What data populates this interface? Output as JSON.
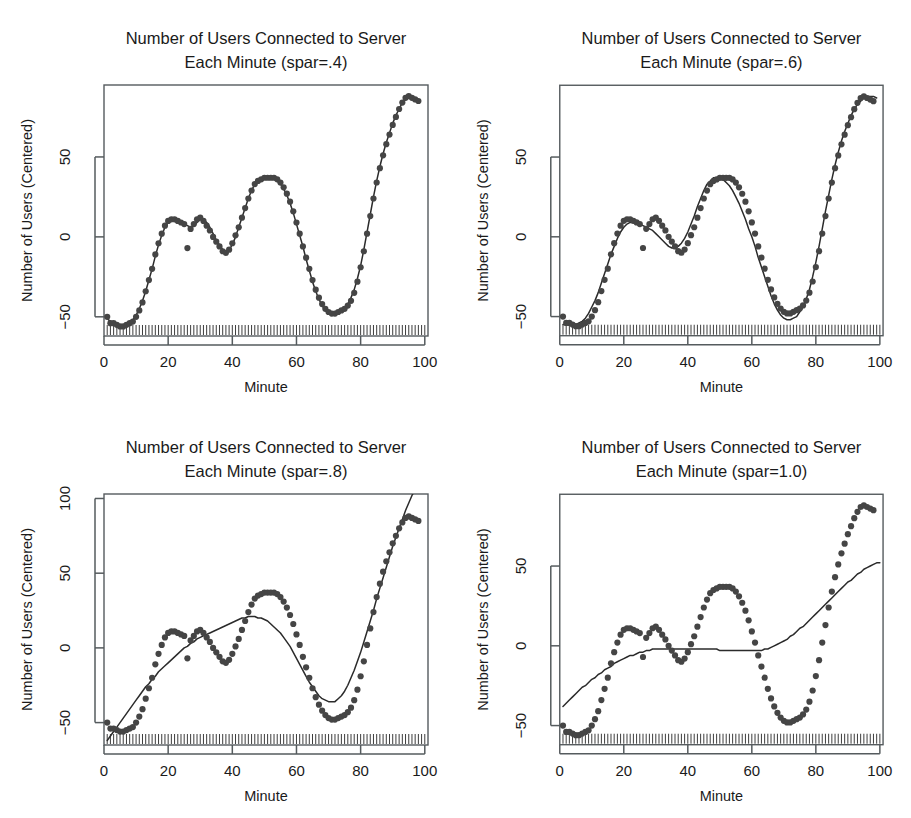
{
  "figure": {
    "panel_count": 4,
    "background_color": "#ffffff",
    "point_color": "#454545",
    "line_color": "#2b2b2b",
    "axis_color": "#555b5e"
  },
  "chart_data": [
    {
      "type": "scatter",
      "panel_index": 0,
      "title": "Number of Users Connected to Server\nEach Minute (spar=.4)",
      "title_line1": "Number of Users Connected to Server",
      "title_line2": "Each Minute (spar=.4)",
      "spar": 0.4,
      "xlabel": "Minute",
      "ylabel": "Number of Users (Centered)",
      "xlim": [
        0,
        101
      ],
      "ylim": [
        -62,
        95
      ],
      "xticks": [
        0,
        20,
        40,
        60,
        80,
        100
      ],
      "yticks": [
        -50,
        0,
        50
      ],
      "grid": false,
      "legend": null,
      "rug": true,
      "x": [
        1,
        2,
        3,
        4,
        5,
        6,
        7,
        8,
        9,
        10,
        11,
        12,
        13,
        14,
        15,
        16,
        17,
        18,
        19,
        20,
        21,
        22,
        23,
        24,
        25,
        26,
        27,
        28,
        29,
        30,
        31,
        32,
        33,
        34,
        35,
        36,
        37,
        38,
        39,
        40,
        41,
        42,
        43,
        44,
        45,
        46,
        47,
        48,
        49,
        50,
        51,
        52,
        53,
        54,
        55,
        56,
        57,
        58,
        59,
        60,
        61,
        62,
        63,
        64,
        65,
        66,
        67,
        68,
        69,
        70,
        71,
        72,
        73,
        74,
        75,
        76,
        77,
        78,
        79,
        80,
        81,
        82,
        83,
        84,
        85,
        86,
        87,
        88,
        89,
        90,
        91,
        92,
        93,
        94,
        95,
        96,
        97,
        98,
        99,
        100
      ],
      "values": [
        -50,
        -54,
        -54,
        -55,
        -56,
        -56,
        -55,
        -54,
        -53,
        -50,
        -46,
        -41,
        -34,
        -27,
        -20,
        -11,
        -4,
        2,
        7,
        10,
        11,
        11,
        10,
        9,
        8,
        -7,
        5,
        8,
        11,
        12,
        10,
        7,
        4,
        0,
        -3,
        -6,
        -9,
        -10,
        -8,
        -4,
        1,
        6,
        12,
        18,
        24,
        29,
        33,
        35,
        36,
        37,
        37,
        37,
        37,
        36,
        34,
        31,
        27,
        22,
        16,
        9,
        2,
        -6,
        -13,
        -20,
        -27,
        -33,
        -38,
        -42,
        -45,
        -47,
        -48,
        -48,
        -47,
        -46,
        -45,
        -43,
        -40,
        -35,
        -28,
        -19,
        -9,
        2,
        13,
        24,
        34,
        43,
        51,
        58,
        64,
        70,
        75,
        80,
        84,
        87,
        88,
        87,
        86,
        85
      ],
      "series": [
        {
          "name": "observed",
          "kind": "points"
        },
        {
          "name": "smoothing spline (spar=.4)",
          "kind": "line",
          "values": [
            -51,
            -53,
            -54,
            -55,
            -55,
            -55,
            -55,
            -54,
            -52,
            -49,
            -45,
            -40,
            -34,
            -27,
            -20,
            -12,
            -5,
            1,
            6,
            9,
            11,
            11,
            10,
            9,
            8,
            7,
            6,
            7,
            9,
            11,
            11,
            9,
            6,
            2,
            -2,
            -5,
            -8,
            -9,
            -8,
            -5,
            0,
            6,
            12,
            18,
            24,
            29,
            33,
            35,
            37,
            37,
            37,
            37,
            36,
            35,
            33,
            30,
            26,
            21,
            15,
            8,
            1,
            -6,
            -14,
            -21,
            -28,
            -34,
            -39,
            -43,
            -46,
            -47,
            -48,
            -48,
            -47,
            -46,
            -44,
            -42,
            -38,
            -33,
            -26,
            -18,
            -8,
            3,
            14,
            25,
            35,
            44,
            52,
            59,
            65,
            71,
            76,
            80,
            84,
            86,
            87,
            87,
            86,
            85
          ]
        }
      ]
    },
    {
      "type": "scatter",
      "panel_index": 1,
      "title": "Number of Users Connected to Server\nEach Minute (spar=.6)",
      "title_line1": "Number of Users Connected to Server",
      "title_line2": "Each Minute (spar=.6)",
      "spar": 0.6,
      "xlabel": "Minute",
      "ylabel": "Number of Users (Centered)",
      "xlim": [
        0,
        101
      ],
      "ylim": [
        -62,
        95
      ],
      "xticks": [
        0,
        20,
        40,
        60,
        80,
        100
      ],
      "yticks": [
        -50,
        0,
        50
      ],
      "grid": false,
      "legend": null,
      "rug": true,
      "x": [
        1,
        2,
        3,
        4,
        5,
        6,
        7,
        8,
        9,
        10,
        11,
        12,
        13,
        14,
        15,
        16,
        17,
        18,
        19,
        20,
        21,
        22,
        23,
        24,
        25,
        26,
        27,
        28,
        29,
        30,
        31,
        32,
        33,
        34,
        35,
        36,
        37,
        38,
        39,
        40,
        41,
        42,
        43,
        44,
        45,
        46,
        47,
        48,
        49,
        50,
        51,
        52,
        53,
        54,
        55,
        56,
        57,
        58,
        59,
        60,
        61,
        62,
        63,
        64,
        65,
        66,
        67,
        68,
        69,
        70,
        71,
        72,
        73,
        74,
        75,
        76,
        77,
        78,
        79,
        80,
        81,
        82,
        83,
        84,
        85,
        86,
        87,
        88,
        89,
        90,
        91,
        92,
        93,
        94,
        95,
        96,
        97,
        98,
        99,
        100
      ],
      "values": [
        -50,
        -54,
        -54,
        -55,
        -56,
        -56,
        -55,
        -54,
        -53,
        -50,
        -46,
        -41,
        -34,
        -27,
        -20,
        -11,
        -4,
        2,
        7,
        10,
        11,
        11,
        10,
        9,
        8,
        -7,
        5,
        8,
        11,
        12,
        10,
        7,
        4,
        0,
        -3,
        -6,
        -9,
        -10,
        -8,
        -4,
        1,
        6,
        12,
        18,
        24,
        29,
        33,
        35,
        36,
        37,
        37,
        37,
        37,
        36,
        34,
        31,
        27,
        22,
        16,
        9,
        2,
        -6,
        -13,
        -20,
        -27,
        -33,
        -38,
        -42,
        -45,
        -47,
        -48,
        -48,
        -47,
        -46,
        -45,
        -43,
        -40,
        -35,
        -28,
        -19,
        -9,
        2,
        13,
        24,
        34,
        43,
        51,
        58,
        64,
        70,
        75,
        80,
        84,
        87,
        88,
        87,
        86,
        85
      ],
      "series": [
        {
          "name": "observed",
          "kind": "points"
        },
        {
          "name": "smoothing spline (spar=.6)",
          "kind": "line",
          "values": [
            -55,
            -55,
            -55,
            -55,
            -55,
            -54,
            -53,
            -51,
            -48,
            -44,
            -40,
            -35,
            -29,
            -23,
            -17,
            -11,
            -6,
            -1,
            3,
            6,
            8,
            9,
            9,
            9,
            8,
            7,
            6,
            5,
            4,
            2,
            0,
            -2,
            -4,
            -6,
            -7,
            -7,
            -6,
            -4,
            -1,
            3,
            8,
            13,
            19,
            24,
            29,
            33,
            35,
            37,
            37,
            37,
            36,
            34,
            32,
            29,
            25,
            21,
            16,
            11,
            5,
            0,
            -6,
            -13,
            -19,
            -25,
            -31,
            -37,
            -42,
            -46,
            -49,
            -51,
            -52,
            -52,
            -51,
            -50,
            -47,
            -44,
            -39,
            -33,
            -25,
            -16,
            -6,
            5,
            16,
            26,
            36,
            45,
            53,
            60,
            66,
            71,
            76,
            80,
            83,
            85,
            87,
            88,
            88,
            88,
            87
          ]
        }
      ]
    },
    {
      "type": "scatter",
      "panel_index": 2,
      "title": "Number of Users Connected to Server\nEach Minute (spar=.8)",
      "title_line1": "Number of Users Connected to Server",
      "title_line2": "Each Minute (spar=.8)",
      "spar": 0.8,
      "xlabel": "Minute",
      "ylabel": "Number of Users (Centered)",
      "xlim": [
        0,
        101
      ],
      "ylim": [
        -65,
        103
      ],
      "xticks": [
        0,
        20,
        40,
        60,
        80,
        100
      ],
      "yticks": [
        -50,
        0,
        50,
        100
      ],
      "grid": false,
      "legend": null,
      "rug": true,
      "x": [
        1,
        2,
        3,
        4,
        5,
        6,
        7,
        8,
        9,
        10,
        11,
        12,
        13,
        14,
        15,
        16,
        17,
        18,
        19,
        20,
        21,
        22,
        23,
        24,
        25,
        26,
        27,
        28,
        29,
        30,
        31,
        32,
        33,
        34,
        35,
        36,
        37,
        38,
        39,
        40,
        41,
        42,
        43,
        44,
        45,
        46,
        47,
        48,
        49,
        50,
        51,
        52,
        53,
        54,
        55,
        56,
        57,
        58,
        59,
        60,
        61,
        62,
        63,
        64,
        65,
        66,
        67,
        68,
        69,
        70,
        71,
        72,
        73,
        74,
        75,
        76,
        77,
        78,
        79,
        80,
        81,
        82,
        83,
        84,
        85,
        86,
        87,
        88,
        89,
        90,
        91,
        92,
        93,
        94,
        95,
        96,
        97,
        98,
        99,
        100
      ],
      "values": [
        -50,
        -54,
        -54,
        -55,
        -56,
        -56,
        -55,
        -54,
        -53,
        -50,
        -46,
        -41,
        -34,
        -27,
        -20,
        -11,
        -4,
        2,
        7,
        10,
        11,
        11,
        10,
        9,
        8,
        -7,
        5,
        8,
        11,
        12,
        10,
        7,
        4,
        0,
        -3,
        -6,
        -9,
        -10,
        -8,
        -4,
        1,
        6,
        12,
        18,
        24,
        29,
        33,
        35,
        36,
        37,
        37,
        37,
        37,
        36,
        34,
        31,
        27,
        22,
        16,
        9,
        2,
        -6,
        -13,
        -20,
        -27,
        -33,
        -38,
        -42,
        -45,
        -47,
        -48,
        -48,
        -47,
        -46,
        -45,
        -43,
        -40,
        -35,
        -28,
        -19,
        -9,
        2,
        13,
        24,
        34,
        43,
        51,
        58,
        64,
        70,
        75,
        80,
        84,
        87,
        88,
        87,
        86,
        85
      ],
      "series": [
        {
          "name": "observed",
          "kind": "points"
        },
        {
          "name": "smoothing spline (spar=.8)",
          "kind": "line",
          "values": [
            -62,
            -59,
            -56,
            -53,
            -50,
            -47,
            -44,
            -41,
            -38,
            -35,
            -32,
            -29,
            -26,
            -24,
            -21,
            -19,
            -16,
            -14,
            -12,
            -10,
            -8,
            -6,
            -4,
            -2,
            0,
            1,
            3,
            4,
            6,
            7,
            8,
            9,
            10,
            11,
            12,
            13,
            14,
            15,
            16,
            17,
            18,
            19,
            20,
            20,
            21,
            21,
            21,
            20,
            20,
            19,
            18,
            16,
            14,
            12,
            10,
            7,
            4,
            1,
            -3,
            -7,
            -11,
            -15,
            -19,
            -23,
            -26,
            -29,
            -32,
            -34,
            -35,
            -36,
            -36,
            -36,
            -34,
            -32,
            -29,
            -25,
            -20,
            -15,
            -9,
            -3,
            4,
            11,
            18,
            25,
            33,
            40,
            47,
            54,
            61,
            68,
            74,
            80,
            86,
            92,
            97,
            102,
            106
          ]
        }
      ]
    },
    {
      "type": "scatter",
      "panel_index": 3,
      "title": "Number of Users Connected to Server\nEach Minute (spar=1.0)",
      "title_line1": "Number of Users Connected to Server",
      "title_line2": "Each Minute (spar=1.0)",
      "spar": 1.0,
      "xlabel": "Minute",
      "ylabel": "Number of Users (Centered)",
      "xlim": [
        0,
        101
      ],
      "ylim": [
        -62,
        95
      ],
      "xticks": [
        0,
        20,
        40,
        60,
        80,
        100
      ],
      "yticks": [
        -50,
        0,
        50
      ],
      "grid": false,
      "legend": null,
      "rug": true,
      "x": [
        1,
        2,
        3,
        4,
        5,
        6,
        7,
        8,
        9,
        10,
        11,
        12,
        13,
        14,
        15,
        16,
        17,
        18,
        19,
        20,
        21,
        22,
        23,
        24,
        25,
        26,
        27,
        28,
        29,
        30,
        31,
        32,
        33,
        34,
        35,
        36,
        37,
        38,
        39,
        40,
        41,
        42,
        43,
        44,
        45,
        46,
        47,
        48,
        49,
        50,
        51,
        52,
        53,
        54,
        55,
        56,
        57,
        58,
        59,
        60,
        61,
        62,
        63,
        64,
        65,
        66,
        67,
        68,
        69,
        70,
        71,
        72,
        73,
        74,
        75,
        76,
        77,
        78,
        79,
        80,
        81,
        82,
        83,
        84,
        85,
        86,
        87,
        88,
        89,
        90,
        91,
        92,
        93,
        94,
        95,
        96,
        97,
        98,
        99,
        100
      ],
      "values": [
        -50,
        -54,
        -54,
        -55,
        -56,
        -56,
        -55,
        -54,
        -53,
        -50,
        -46,
        -41,
        -34,
        -27,
        -20,
        -11,
        -4,
        2,
        7,
        10,
        11,
        11,
        10,
        9,
        8,
        -7,
        5,
        8,
        11,
        12,
        10,
        7,
        4,
        0,
        -3,
        -6,
        -9,
        -10,
        -8,
        -4,
        1,
        6,
        12,
        18,
        24,
        29,
        33,
        35,
        36,
        37,
        37,
        37,
        37,
        36,
        34,
        31,
        27,
        22,
        16,
        9,
        2,
        -6,
        -13,
        -20,
        -27,
        -33,
        -38,
        -42,
        -45,
        -47,
        -48,
        -48,
        -47,
        -46,
        -45,
        -43,
        -40,
        -35,
        -28,
        -19,
        -9,
        2,
        13,
        24,
        34,
        43,
        51,
        58,
        64,
        70,
        75,
        80,
        84,
        87,
        88,
        87,
        86,
        85
      ],
      "series": [
        {
          "name": "observed",
          "kind": "points"
        },
        {
          "name": "smoothing spline (spar=1.0)",
          "kind": "line",
          "values": [
            -38,
            -36,
            -34,
            -32,
            -30,
            -28,
            -26,
            -25,
            -23,
            -21,
            -20,
            -18,
            -17,
            -15,
            -14,
            -13,
            -11,
            -10,
            -9,
            -8,
            -7,
            -6,
            -6,
            -5,
            -4,
            -4,
            -3,
            -3,
            -2,
            -2,
            -2,
            -2,
            -2,
            -2,
            -2,
            -2,
            -2,
            -2,
            -2,
            -2,
            -2,
            -2,
            -2,
            -2,
            -2,
            -2,
            -2,
            -2,
            -2,
            -3,
            -3,
            -3,
            -3,
            -3,
            -3,
            -3,
            -3,
            -3,
            -3,
            -3,
            -3,
            -3,
            -3,
            -2,
            -2,
            -1,
            0,
            1,
            2,
            3,
            4,
            6,
            7,
            9,
            11,
            12,
            14,
            16,
            18,
            20,
            22,
            24,
            26,
            28,
            30,
            32,
            34,
            36,
            38,
            40,
            41,
            43,
            45,
            46,
            48,
            49,
            50,
            51,
            52,
            52
          ]
        }
      ]
    }
  ]
}
